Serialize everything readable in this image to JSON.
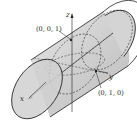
{
  "diagram": {
    "type": "3d-geometry",
    "axes": {
      "x": "x",
      "y": "y",
      "z": "z"
    },
    "points": [
      {
        "label": "(0, 0, 1)"
      },
      {
        "label": "(0, 1, 0)"
      }
    ],
    "colors": {
      "surface": "#d9d9d9",
      "line": "#222222"
    }
  }
}
